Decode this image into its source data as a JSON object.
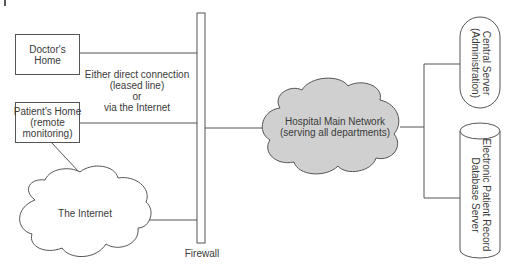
{
  "diagram": {
    "nodes": {
      "doctors_home": {
        "line1": "Doctor's",
        "line2": "Home"
      },
      "patients_home": {
        "line1": "Patient's Home",
        "line2": "(remote",
        "line3": "monitoring)"
      },
      "internet": {
        "label": "The Internet"
      },
      "firewall": {
        "label": "Firewall"
      },
      "hospital_network": {
        "line1": "Hospital Main Network",
        "line2": "(serving all departments)"
      },
      "central_server": {
        "line1": "Central Server",
        "line2": "(Administration)"
      },
      "epr_server": {
        "line1": "Electronic Patient Record",
        "line2": "Database Server"
      }
    },
    "annotation": {
      "line1": "Either direct connection",
      "line2": "(leased line)",
      "line3": "or",
      "line4": "via the Internet"
    },
    "edges": [
      {
        "from": "doctors_home",
        "to": "firewall"
      },
      {
        "from": "patients_home",
        "to": "firewall"
      },
      {
        "from": "patients_home",
        "to": "internet"
      },
      {
        "from": "internet",
        "to": "firewall"
      },
      {
        "from": "firewall",
        "to": "hospital_network"
      },
      {
        "from": "hospital_network",
        "to": "central_server"
      },
      {
        "from": "hospital_network",
        "to": "epr_server"
      }
    ],
    "colors": {
      "stroke": "#555555",
      "hospital_cloud_fill": "#d0d0d0",
      "internet_cloud_fill": "#ffffff",
      "text": "#3a3a3a"
    }
  }
}
